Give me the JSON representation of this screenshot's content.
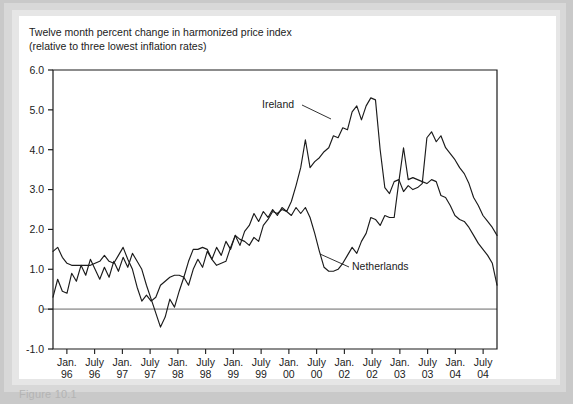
{
  "figure": {
    "title_line1": "Twelve month percent change in harmonized price index",
    "title_line2": "(relative to three lowest inflation rates)",
    "caption_partial": "Figure 10.1"
  },
  "chart_data": {
    "type": "line",
    "title": "Twelve month percent change in harmonized price index (relative to three lowest inflation rates)",
    "xlabel": "",
    "ylabel": "",
    "grid": false,
    "legend_position": "inline-annotations",
    "ylim": [
      -1.0,
      6.0
    ],
    "ytick_labels": [
      "6.0",
      "5.0",
      "4.0",
      "3.0",
      "2.0",
      "1.0",
      "0",
      "-1.0"
    ],
    "ytick_values": [
      6.0,
      5.0,
      4.0,
      3.0,
      2.0,
      1.0,
      0,
      -1.0
    ],
    "zero_line": 0,
    "xtick_labels": [
      "Jan.\n96",
      "July\n96",
      "Jan.\n97",
      "July\n97",
      "Jan.\n98",
      "July\n98",
      "Jan.\n99",
      "July\n99",
      "Jan.\n00",
      "July\n00",
      "Jan.\n02",
      "July\n02",
      "Jan.\n03",
      "July\n03",
      "Jan.\n04",
      "July\n04"
    ],
    "xtick_months": [
      "Jan.",
      "July",
      "Jan.",
      "July",
      "Jan.",
      "July",
      "Jan.",
      "July",
      "Jan.",
      "July",
      "Jan.",
      "July",
      "Jan.",
      "July",
      "Jan.",
      "July"
    ],
    "xtick_years": [
      "96",
      "96",
      "97",
      "97",
      "98",
      "98",
      "99",
      "99",
      "00",
      "00",
      "02",
      "02",
      "03",
      "03",
      "04",
      "04"
    ],
    "x_index_count": 96,
    "series": [
      {
        "name": "Ireland",
        "annotation": "Ireland",
        "color": "#1b1b1b",
        "values": [
          0.3,
          0.75,
          0.45,
          0.4,
          0.9,
          0.7,
          1.1,
          0.85,
          1.25,
          1.0,
          0.75,
          1.05,
          0.8,
          1.2,
          0.95,
          1.3,
          1.05,
          1.4,
          1.2,
          1.0,
          0.6,
          0.25,
          -0.1,
          -0.45,
          -0.2,
          0.25,
          0.05,
          0.45,
          0.8,
          0.6,
          1.0,
          1.25,
          1.05,
          1.45,
          1.25,
          1.55,
          1.35,
          1.7,
          1.5,
          1.85,
          1.6,
          1.95,
          2.1,
          2.4,
          2.2,
          2.45,
          2.3,
          2.5,
          2.35,
          2.55,
          2.45,
          2.7,
          3.1,
          3.55,
          4.25,
          3.55,
          3.7,
          3.8,
          3.95,
          4.05,
          4.35,
          4.3,
          4.55,
          4.5,
          4.95,
          5.1,
          4.75,
          5.1,
          5.3,
          5.25,
          4.0,
          3.05,
          2.9,
          3.2,
          3.25,
          2.95,
          3.1,
          3.0,
          3.05,
          3.15,
          4.3,
          4.45,
          4.2,
          4.35,
          4.05,
          3.9,
          3.75,
          3.55,
          3.4,
          3.15,
          2.8,
          2.6,
          2.35,
          2.2,
          2.05,
          1.85
        ]
      },
      {
        "name": "Netherlands",
        "annotation": "Netherlands",
        "color": "#1b1b1b",
        "values": [
          1.45,
          1.55,
          1.3,
          1.15,
          1.1,
          1.1,
          1.1,
          1.1,
          1.1,
          1.15,
          1.2,
          1.35,
          1.2,
          1.15,
          1.35,
          1.55,
          1.25,
          1.0,
          0.55,
          0.2,
          0.35,
          0.2,
          0.3,
          0.6,
          0.7,
          0.8,
          0.85,
          0.85,
          0.8,
          1.2,
          1.5,
          1.5,
          1.55,
          1.5,
          1.25,
          1.1,
          1.15,
          1.2,
          1.55,
          1.85,
          1.75,
          1.7,
          1.6,
          1.8,
          1.7,
          2.1,
          2.25,
          2.45,
          2.4,
          2.5,
          2.45,
          2.35,
          2.55,
          2.4,
          2.55,
          2.3,
          1.9,
          1.45,
          1.05,
          0.95,
          0.95,
          1.0,
          1.15,
          1.35,
          1.55,
          1.4,
          1.7,
          1.9,
          2.3,
          2.25,
          2.1,
          2.35,
          2.3,
          2.3,
          3.2,
          4.05,
          3.25,
          3.3,
          3.25,
          3.2,
          3.15,
          3.25,
          3.2,
          2.85,
          2.8,
          2.6,
          2.35,
          2.25,
          2.2,
          2.05,
          1.85,
          1.65,
          1.5,
          1.35,
          1.15,
          0.6
        ]
      }
    ]
  }
}
